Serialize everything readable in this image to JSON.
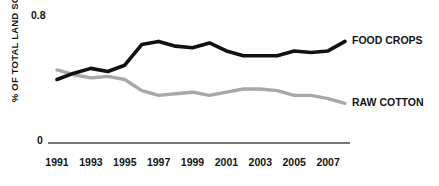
{
  "chart_data": {
    "type": "line",
    "title": "",
    "xlabel": "",
    "ylabel": "% OF TOTAL LAND SOWN",
    "xlim": [
      1991,
      2008
    ],
    "ylim": [
      0,
      0.8
    ],
    "grid": false,
    "legend_position": "right-inline",
    "y_ticks": [
      "0.8",
      "0"
    ],
    "y_tick_values": [
      0.8,
      0
    ],
    "x_tick_labels": [
      "1991",
      "1993",
      "1995",
      "1997",
      "1999",
      "2001",
      "2003",
      "2005",
      "2007"
    ],
    "x_tick_values": [
      1991,
      1993,
      1995,
      1997,
      1999,
      2001,
      2003,
      2005,
      2007
    ],
    "x": [
      1991,
      1992,
      1993,
      1994,
      1995,
      1996,
      1997,
      1998,
      1999,
      2000,
      2001,
      2002,
      2003,
      2004,
      2005,
      2006,
      2007,
      2008
    ],
    "series": [
      {
        "name": "FOOD CROPS",
        "color": "#111111",
        "values": [
          0.4,
          0.44,
          0.47,
          0.45,
          0.49,
          0.62,
          0.64,
          0.61,
          0.6,
          0.63,
          0.58,
          0.55,
          0.55,
          0.55,
          0.58,
          0.57,
          0.58,
          0.64
        ]
      },
      {
        "name": "RAW COTTON",
        "color": "#a8a8a8",
        "values": [
          0.46,
          0.43,
          0.41,
          0.42,
          0.4,
          0.33,
          0.3,
          0.31,
          0.32,
          0.3,
          0.32,
          0.34,
          0.34,
          0.33,
          0.3,
          0.3,
          0.28,
          0.25
        ]
      }
    ],
    "annotations": []
  },
  "axis": {
    "y_label": "% OF TOTAL LAND SOWN",
    "y_tick_top": "0.8",
    "y_tick_bottom": "0"
  },
  "legend": {
    "food_crops": "FOOD CROPS",
    "raw_cotton": "RAW COTTON"
  },
  "colors": {
    "food_crops": "#111111",
    "raw_cotton": "#a8a8a8",
    "axis": "#4a4a4a",
    "text": "#141414",
    "background": "#ffffff"
  }
}
